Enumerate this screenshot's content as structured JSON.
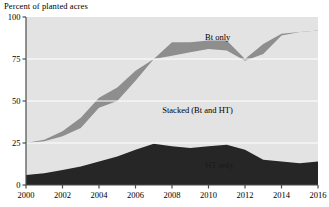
{
  "chart_data": {
    "type": "area",
    "title": "Percent of planted acres",
    "xlabel": "",
    "ylabel": "Percent of planted acres",
    "stacked": true,
    "grid": true,
    "legend_position": "inline-annotations",
    "xlim": [
      2000,
      2016
    ],
    "ylim": [
      0,
      100
    ],
    "yticks": [
      0,
      25,
      50,
      75,
      100
    ],
    "ytick_labels": [
      "0",
      "25",
      "50",
      "75",
      "100"
    ],
    "xticks": [
      2000,
      2002,
      2004,
      2006,
      2008,
      2010,
      2012,
      2014,
      2016
    ],
    "xtick_labels": [
      "2000",
      "2002",
      "2004",
      "2006",
      "2008",
      "2010",
      "2012",
      "2014",
      "2016"
    ],
    "x": [
      2000,
      2001,
      2002,
      2003,
      2004,
      2005,
      2006,
      2007,
      2008,
      2009,
      2010,
      2011,
      2012,
      2013,
      2014,
      2015,
      2016
    ],
    "series": [
      {
        "name": "HT only",
        "color": "#262626",
        "values": [
          6,
          7,
          9,
          11,
          14,
          17,
          21,
          24.5,
          23,
          22,
          23,
          24,
          21,
          15,
          14,
          13,
          14
        ]
      },
      {
        "name": "Stacked (Bt and HT)",
        "color": "#e3e3e3",
        "values": [
          13,
          11,
          12,
          14,
          18,
          19,
          23,
          33,
          40,
          45,
          49,
          48,
          52,
          60,
          63,
          66,
          67
        ]
      },
      {
        "name": "Bt only",
        "color": "#8e8e8e",
        "values": [
          6,
          8,
          10,
          12,
          15,
          14,
          13,
          18,
          21,
          18,
          15,
          13,
          2,
          8,
          14,
          12,
          11
        ]
      }
    ],
    "cumulative_top_boundaries": {
      "ht_only_top": [
        6,
        7,
        9,
        11,
        14,
        17,
        21,
        24.5,
        23,
        22,
        23,
        24,
        21,
        15,
        14,
        13,
        14
      ],
      "stacked_top": [
        25,
        26,
        29,
        34,
        46,
        50,
        62,
        75,
        77,
        79,
        81,
        80,
        74,
        78,
        89,
        91,
        92
      ],
      "bt_only_top": [
        25,
        27,
        32,
        40,
        52,
        58,
        68,
        75,
        85,
        85,
        86,
        86,
        75,
        84,
        90,
        91,
        92
      ]
    },
    "annotations": [
      {
        "text": "Bt only",
        "x": 2010.5,
        "y": 86.5
      },
      {
        "text": "Stacked (Bt and HT)",
        "x": 2009.4,
        "y": 43
      },
      {
        "text": "HT only",
        "x": 2010.6,
        "y": 10
      }
    ]
  },
  "colors": {
    "background": "#ffffff",
    "plot_background": "#e3e3e3",
    "ht_only": "#262626",
    "stacked": "#e3e3e3",
    "bt_only": "#8e8e8e",
    "axis": "#4d4d4d",
    "gridline": "#ffffff",
    "text": "#000000"
  }
}
